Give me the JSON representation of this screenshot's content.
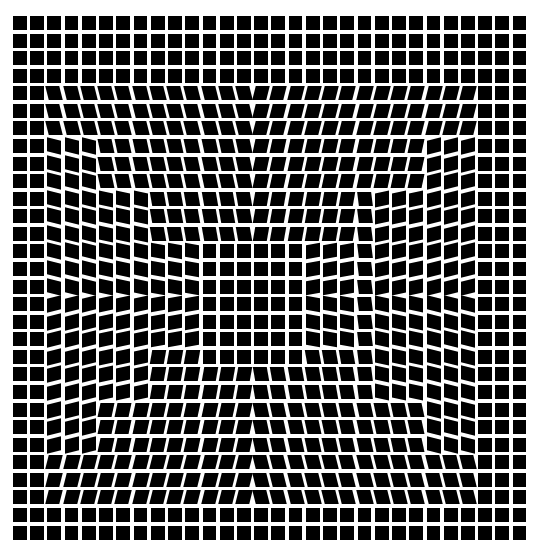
{
  "artwork": {
    "title": "Op-art grid of black squares with nested distorted frames",
    "background_color": "#ffffff",
    "cell_color": "#000000",
    "columns": 30,
    "rows": 30,
    "pitch_x": 17.23,
    "pitch_y": 17.57,
    "cell_fill": 0.8,
    "regions": [
      {
        "name": "frame-a",
        "c0": 2,
        "c1": 26,
        "r0": 4,
        "r1": 27,
        "band": 3,
        "skew": 14
      },
      {
        "name": "frame-b",
        "c0": 5,
        "c1": 23,
        "r0": 7,
        "r1": 24,
        "band": 3,
        "skew": 12
      },
      {
        "name": "frame-c",
        "c0": 8,
        "c1": 19,
        "r0": 10,
        "r1": 21,
        "band": 3,
        "skew": 10
      },
      {
        "name": "center-plain",
        "c0": 11,
        "c1": 16,
        "r0": 13,
        "r1": 19,
        "band": 0,
        "skew": 0
      }
    ]
  }
}
